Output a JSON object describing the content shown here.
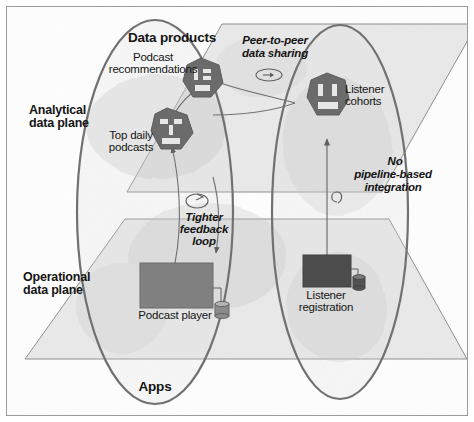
{
  "figure": {
    "type": "conceptual-architecture-diagram",
    "background_color": "#ffffff",
    "frame_color": "#9a9a9a",
    "plane_fill": "#e3e3e3",
    "plane_stroke": "#8d8d8d",
    "ellipse_stroke": "#6f6f6f",
    "hexagon_color": "#6b6b6b",
    "app_box_color": "#7f7f7f",
    "app_box_dark_color": "#4a4a4a",
    "text_color": "#141414"
  },
  "planes": [
    {
      "id": "analytical",
      "label": "Analytical\ndata plane",
      "label_line1": "Analytical",
      "label_line2": "data plane"
    },
    {
      "id": "operational",
      "label": "Operational\ndata plane",
      "label_line1": "Operational",
      "label_line2": "data plane"
    }
  ],
  "sections": {
    "data_products_header": "Data products",
    "apps_header": "Apps"
  },
  "domains": [
    {
      "id": "podcast-domain",
      "data_products": [
        {
          "name": "Podcast\nrecommendations",
          "line1": "Podcast",
          "line2": "recommendations",
          "icon": "data-product-hexagon-icon"
        },
        {
          "name": "Top daily\npodcasts",
          "line1": "Top daily",
          "line2": "podcasts",
          "icon": "data-product-hexagon-icon"
        }
      ],
      "apps": [
        {
          "name": "Podcast player",
          "icon": "application-box-icon",
          "has_database": true
        }
      ]
    },
    {
      "id": "listener-domain",
      "data_products": [
        {
          "name": "Listener\ncohorts",
          "line1": "Listener",
          "line2": "cohorts",
          "icon": "data-product-hexagon-icon"
        }
      ],
      "apps": [
        {
          "name": "Listener\nregistration",
          "line1": "Listener",
          "line2": "registration",
          "icon": "application-box-icon",
          "has_database": true
        }
      ]
    }
  ],
  "annotations": [
    {
      "id": "peer-to-peer",
      "line1": "Peer-to-peer",
      "line2": "data sharing",
      "icon": "bidirectional-arrow-icon",
      "style": "italic"
    },
    {
      "id": "no-pipeline",
      "line1": "No",
      "line2": "pipeline-based",
      "line3": "integration",
      "icon": "loop-arrow-icon",
      "style": "italic"
    },
    {
      "id": "tighter-feedback",
      "line1": "Tighter",
      "line2": "feedback",
      "line3": "loop",
      "icon": "loop-arrow-icon",
      "style": "italic"
    }
  ]
}
